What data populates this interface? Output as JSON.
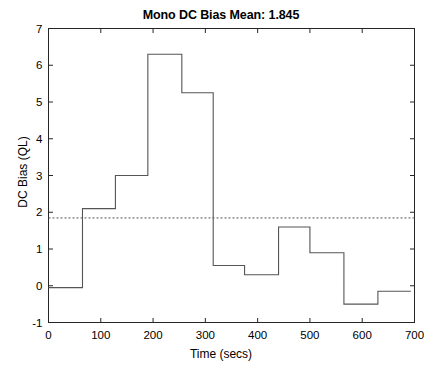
{
  "chart_data": {
    "type": "line",
    "subtype": "step",
    "title": "Mono DC Bias Mean: 1.845",
    "xlabel": "Time (secs)",
    "ylabel": "DC Bias (QL)",
    "xlim": [
      0,
      700
    ],
    "ylim": [
      -1,
      7
    ],
    "xticks": [
      0,
      100,
      200,
      300,
      400,
      500,
      600,
      700
    ],
    "yticks": [
      -1,
      0,
      1,
      2,
      3,
      4,
      5,
      6,
      7
    ],
    "grid": false,
    "legend": null,
    "line_color": "#555555",
    "mean_line": {
      "value": 1.845,
      "style": "dotted",
      "label": "Mean 1.845",
      "color": "#555555"
    },
    "step_edges": [
      0,
      65,
      128,
      190,
      255,
      315,
      375,
      440,
      500,
      565,
      630,
      693
    ],
    "step_values": [
      -0.05,
      2.1,
      3.0,
      6.3,
      5.25,
      0.55,
      0.3,
      1.6,
      0.9,
      -0.5,
      -0.15
    ],
    "series": [
      {
        "name": "Mono DC Bias",
        "x": [
          0,
          65,
          128,
          190,
          255,
          315,
          375,
          440,
          500,
          565,
          630,
          693
        ],
        "y": [
          -0.05,
          2.1,
          3.0,
          6.3,
          5.25,
          0.55,
          0.3,
          1.6,
          0.9,
          -0.5,
          -0.15,
          -0.15
        ]
      }
    ]
  },
  "axes": {
    "x_tick_labels": [
      "0",
      "100",
      "200",
      "300",
      "400",
      "500",
      "600",
      "700"
    ],
    "y_tick_labels": [
      "-1",
      "0",
      "1",
      "2",
      "3",
      "4",
      "5",
      "6",
      "7"
    ]
  }
}
